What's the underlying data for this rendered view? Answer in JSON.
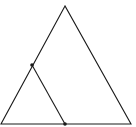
{
  "diagram": {
    "type": "geometry",
    "stroke_color": "#1a1a1a",
    "background": "#ffffff",
    "outer_triangle": {
      "apex": [
        65,
        6
      ],
      "bottom_left": [
        1,
        124
      ],
      "bottom_right": [
        131,
        124
      ]
    },
    "inner_segment": {
      "from": [
        32,
        65
      ],
      "to": [
        65,
        124
      ]
    },
    "points": [
      {
        "name": "left-side-point",
        "xy": [
          32,
          65
        ]
      },
      {
        "name": "base-point",
        "xy": [
          65,
          124
        ]
      }
    ]
  }
}
